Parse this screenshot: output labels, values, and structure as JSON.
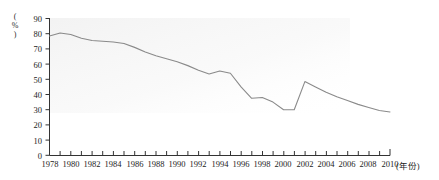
{
  "chart_data": {
    "type": "line",
    "title": "",
    "subtitle": "",
    "xlabel": "(年份)",
    "ylabel": "(%)",
    "ylabel_chars": [
      "(",
      "%",
      ")"
    ],
    "xlim": [
      1978,
      2010
    ],
    "ylim": [
      0,
      90
    ],
    "ytick_step": 10,
    "xtick_step": 2,
    "xminor_tick_step": 1,
    "grid": false,
    "legend": null,
    "line_color": "#8a8a8a",
    "yticks": [
      "0",
      "10",
      "20",
      "30",
      "40",
      "50",
      "60",
      "70",
      "80",
      "90"
    ],
    "xticks": [
      "1978",
      "1980",
      "1982",
      "1984",
      "1986",
      "1988",
      "1990",
      "1992",
      "1994",
      "1996",
      "1998",
      "2000",
      "2002",
      "2004",
      "2006",
      "2008",
      "2010"
    ],
    "x": [
      1978,
      1979,
      1980,
      1981,
      1982,
      1983,
      1984,
      1985,
      1986,
      1987,
      1988,
      1989,
      1990,
      1991,
      1992,
      1993,
      1994,
      1995,
      1996,
      1997,
      1998,
      1999,
      2000,
      2001,
      2002,
      2003,
      2004,
      2005,
      2006,
      2007,
      2008,
      2009,
      2010
    ],
    "series": [
      {
        "name": "比重",
        "values": [
          78.5,
          80.5,
          79.5,
          77.0,
          75.5,
          75.0,
          74.5,
          73.5,
          71.0,
          68.0,
          65.5,
          63.5,
          61.5,
          59.0,
          56.0,
          53.5,
          55.5,
          54.0,
          45.0,
          37.5,
          38.0,
          35.0,
          30.0,
          30.0,
          48.5,
          45.0,
          41.5,
          38.5,
          36.0,
          33.5,
          31.5,
          29.5,
          28.5
        ]
      }
    ]
  }
}
